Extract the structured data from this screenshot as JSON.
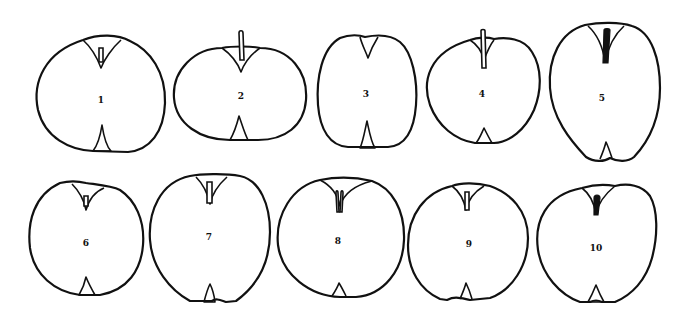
{
  "figure": {
    "line_color": "#111111",
    "background": "#ffffff",
    "apples": [
      {
        "label": "1",
        "row": 1
      },
      {
        "label": "2",
        "row": 1
      },
      {
        "label": "3",
        "row": 1
      },
      {
        "label": "4",
        "row": 1
      },
      {
        "label": "5",
        "row": 1
      },
      {
        "label": "6",
        "row": 2
      },
      {
        "label": "7",
        "row": 2
      },
      {
        "label": "8",
        "row": 2
      },
      {
        "label": "9",
        "row": 2
      },
      {
        "label": "10",
        "row": 2
      }
    ]
  }
}
